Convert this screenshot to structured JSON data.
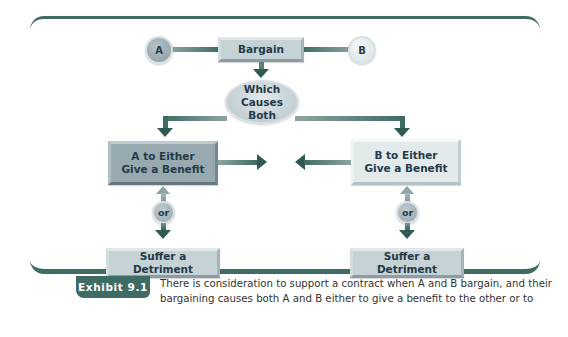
{
  "diagram": {
    "nodes": {
      "party_a": "A",
      "party_b": "B",
      "bargain": "Bargain",
      "which_causes": "Which Causes\nBoth",
      "which_causes_line1": "Which Causes",
      "which_causes_line2": "Both",
      "a_benefit_line1": "A to Either",
      "a_benefit_line2": "Give a Benefit",
      "b_benefit_line1": "B to Either",
      "b_benefit_line2": "Give a Benefit",
      "or_left": "or",
      "or_right": "or",
      "a_detriment": "Suffer a Detriment",
      "b_detriment": "Suffer a Detriment"
    },
    "edges": [
      {
        "from": "A",
        "to": "Bargain"
      },
      {
        "from": "B",
        "to": "Bargain"
      },
      {
        "from": "Bargain",
        "to": "Which Causes Both"
      },
      {
        "from": "Which Causes Both",
        "to": "A to Either Give a Benefit"
      },
      {
        "from": "Which Causes Both",
        "to": "B to Either Give a Benefit"
      },
      {
        "from": "A to Either Give a Benefit",
        "to": "center"
      },
      {
        "from": "B to Either Give a Benefit",
        "to": "center"
      },
      {
        "from": "A to Either Give a Benefit",
        "to": "Suffer a Detriment (A)",
        "label": "or"
      },
      {
        "from": "B to Either Give a Benefit",
        "to": "Suffer a Detriment (B)",
        "label": "or"
      }
    ],
    "colors": {
      "frame": "#3e6b63",
      "arrow": "#2f5a53",
      "box_mid": "#c5d2d6",
      "box_dark": "#98aab0",
      "box_light": "#e3eaec",
      "text": "#243a48"
    }
  },
  "caption": {
    "tag": "Exhibit 9.1",
    "text_line1": "There is consideration to support a contract when A and B bargain, and their",
    "text_line2": "bargaining causes both A and B either to give a benefit to the other or to"
  }
}
